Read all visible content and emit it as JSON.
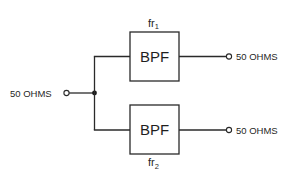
{
  "diagram": {
    "type": "block-diagram",
    "input": {
      "label": "50 OHMS"
    },
    "filters": [
      {
        "id": "bpf-1",
        "label": "BPF",
        "freq_label": "fr",
        "freq_sub": "1",
        "output_label": "50 OHMS"
      },
      {
        "id": "bpf-2",
        "label": "BPF",
        "freq_label": "fr",
        "freq_sub": "2",
        "output_label": "50 OHMS"
      }
    ],
    "colors": {
      "line": "#2a2a2a",
      "text": "#1f1f1f",
      "background": "#ffffff"
    }
  }
}
